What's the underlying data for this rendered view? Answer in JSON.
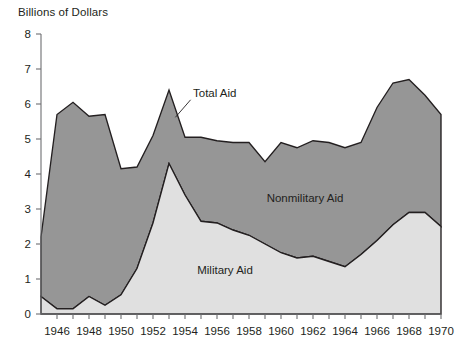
{
  "chart": {
    "axis_title": "Billions of Dollars",
    "y_ticks": [
      "0",
      "1",
      "2",
      "3",
      "4",
      "5",
      "6",
      "7",
      "8"
    ],
    "x_ticks": [
      "1946",
      "1948",
      "1950",
      "1952",
      "1954",
      "1956",
      "1958",
      "1960",
      "1962",
      "1964",
      "1966",
      "1968",
      "1970"
    ],
    "labels": {
      "total": "Total Aid",
      "nonmilitary": "Nonmilitary Aid",
      "military": "Military Aid"
    },
    "colors": {
      "nonmilitary_fill": "#969696",
      "military_fill": "#e0e0e0",
      "outline": "#231f20",
      "axis": "#6d6e71",
      "background": "#ffffff"
    }
  },
  "chart_data": {
    "type": "area",
    "title": "",
    "subtitle": "",
    "xlabel": "",
    "ylabel": "Billions of Dollars",
    "xlim": [
      1945,
      1970
    ],
    "ylim": [
      0,
      8
    ],
    "grid": false,
    "legend": "inline-annotations",
    "stacked": true,
    "x": [
      1945,
      1946,
      1947,
      1948,
      1949,
      1950,
      1951,
      1952,
      1953,
      1954,
      1955,
      1956,
      1957,
      1958,
      1959,
      1960,
      1961,
      1962,
      1963,
      1964,
      1965,
      1966,
      1967,
      1968,
      1969,
      1970
    ],
    "series": [
      {
        "name": "Military Aid",
        "values": [
          0.5,
          0.15,
          0.15,
          0.5,
          0.25,
          0.55,
          1.3,
          2.6,
          4.3,
          3.4,
          2.65,
          2.6,
          2.4,
          2.25,
          2.0,
          1.75,
          1.6,
          1.65,
          1.5,
          1.35,
          1.7,
          2.1,
          2.55,
          2.9,
          2.9,
          2.5
        ]
      },
      {
        "name": "Nonmilitary Aid",
        "values": [
          1.7,
          5.55,
          5.9,
          5.15,
          5.45,
          3.6,
          2.9,
          2.5,
          2.1,
          1.65,
          2.4,
          2.35,
          2.5,
          2.65,
          2.35,
          3.15,
          3.15,
          3.3,
          3.4,
          3.4,
          3.2,
          3.8,
          4.05,
          3.8,
          3.35,
          3.2
        ]
      }
    ],
    "total_aid": [
      2.2,
      5.7,
      6.05,
      5.65,
      5.7,
      4.15,
      4.2,
      5.1,
      6.4,
      5.05,
      5.05,
      4.95,
      4.9,
      4.9,
      4.35,
      4.9,
      4.75,
      4.95,
      4.9,
      4.75,
      4.9,
      5.9,
      6.6,
      6.7,
      6.25,
      5.7
    ],
    "annotations": [
      {
        "text": "Total Aid",
        "x": 1954.5,
        "y": 6.2
      },
      {
        "text": "Nonmilitary Aid",
        "x": 1961.5,
        "y": 3.2
      },
      {
        "text": "Military Aid",
        "x": 1956.5,
        "y": 1.15
      }
    ]
  }
}
